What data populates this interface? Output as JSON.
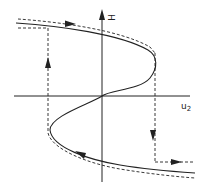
{
  "diagram": {
    "type": "hysteresis-loop",
    "axes": {
      "vertical_label": "H",
      "horizontal_label": "u",
      "horizontal_label_subscript": "2"
    },
    "colors": {
      "line": "#222222",
      "background": "#ffffff"
    },
    "curves": [
      {
        "name": "equilibrium-s-curve",
        "style": "solid"
      },
      {
        "name": "hysteresis-path",
        "style": "dashed"
      }
    ],
    "arrows": [
      {
        "position": "top-branch",
        "direction": "right"
      },
      {
        "position": "left-jump",
        "direction": "up"
      },
      {
        "position": "right-jump",
        "direction": "down"
      },
      {
        "position": "bottom-branch-right",
        "direction": "right"
      },
      {
        "position": "bottom-branch-left",
        "direction": "left"
      }
    ]
  }
}
